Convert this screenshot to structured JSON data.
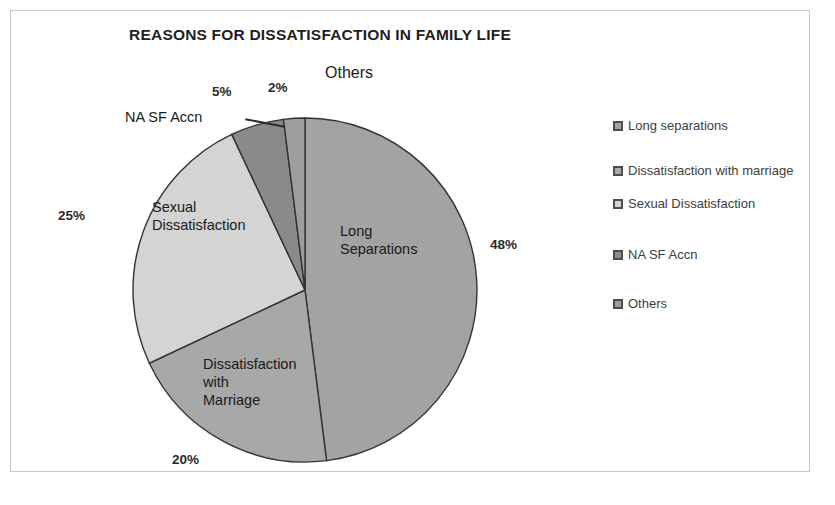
{
  "chart_data": {
    "type": "pie",
    "title": "REASONS FOR DISSATISFACTION IN FAMILY LIFE",
    "categories": [
      "Long separations",
      "Dissatisfaction with marriage",
      "Sexual Dissatisfaction",
      "NA SF Accn",
      "Others"
    ],
    "values": [
      48,
      20,
      25,
      5,
      2
    ],
    "unit": "%",
    "legend_position": "right",
    "grid": false,
    "slices": [
      {
        "label": "Long Separations",
        "legend_label": "Long separations",
        "value": 48,
        "pct_text": "48%",
        "color": "#a3a3a3"
      },
      {
        "label": "Dissatisfaction with Marriage",
        "legend_label": "Dissatisfaction with marriage",
        "value": 20,
        "pct_text": "20%",
        "color": "#a8a8a8"
      },
      {
        "label": "Sexual Dissatisfaction",
        "legend_label": "Sexual Dissatisfaction",
        "value": 25,
        "pct_text": "25%",
        "color": "#d4d4d4"
      },
      {
        "label": "NA SF Accn",
        "legend_label": "NA SF Accn",
        "value": 5,
        "pct_text": "5%",
        "color": "#8a8a8a"
      },
      {
        "label": "Others",
        "legend_label": "Others",
        "value": 2,
        "pct_text": "2%",
        "color": "#9e9e9e"
      }
    ]
  },
  "chart": {
    "title": "REASONS FOR DISSATISFACTION IN FAMILY LIFE",
    "inner_labels": {
      "long_separations": "Long\nSeparations",
      "marriage": "Dissatisfaction\nwith\nMarriage",
      "sexual": "Sexual\nDissatisfaction"
    },
    "outer_labels": {
      "na_sf_accn": "NA SF Accn",
      "others": "Others"
    },
    "percent_labels": {
      "long_separations": "48%",
      "marriage": "20%",
      "sexual": "25%",
      "na_sf_accn": "5%",
      "others": "2%"
    }
  },
  "legend": {
    "items": [
      {
        "label": "Long separations",
        "color": "#a3a3a3"
      },
      {
        "label": "Dissatisfaction with marriage",
        "color": "#a8a8a8"
      },
      {
        "label": "Sexual Dissatisfaction",
        "color": "#d4d4d4"
      },
      {
        "label": "NA SF Accn",
        "color": "#8a8a8a"
      },
      {
        "label": "Others",
        "color": "#9e9e9e"
      }
    ]
  }
}
